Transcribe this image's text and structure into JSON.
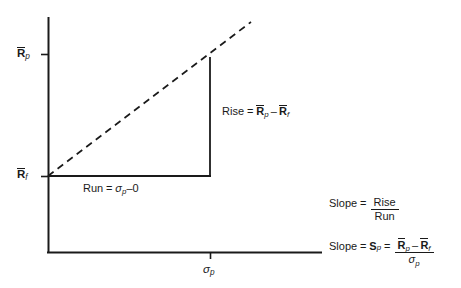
{
  "figure": {
    "width": 461,
    "height": 288,
    "background": "#ffffff",
    "line_color": "#1a1a1a"
  },
  "axes": {
    "y_axis": {
      "name": "expected-return-axis",
      "x": 48,
      "y_top": 17,
      "y_bottom": 253
    },
    "x_axis": {
      "name": "standard-deviation-axis",
      "y": 252,
      "x_left": 48,
      "x_right": 322
    },
    "y_ticks": [
      {
        "label_R": "R",
        "label_sub": "p",
        "value_y": 54,
        "name": "tick-rp"
      },
      {
        "label_R": "R",
        "label_sub": "f",
        "value_y": 176,
        "name": "tick-rf"
      }
    ],
    "x_ticks": [
      {
        "label_sigma": "σ",
        "label_sub": "p",
        "value_x": 210,
        "name": "tick-sigma-p"
      }
    ]
  },
  "labels": {
    "y_top": {
      "base": "R",
      "sub": "p",
      "overbar": true
    },
    "y_bottom": {
      "base": "R",
      "sub": "f",
      "overbar": true
    },
    "x_axis": {
      "base": "σ",
      "sub": "p",
      "overbar": false
    }
  },
  "annotations": {
    "rise": {
      "prefix": "Rise",
      "eq": "=",
      "term1": {
        "base": "R",
        "sub": "p",
        "overbar": true
      },
      "minus": "–",
      "term2": {
        "base": "R",
        "sub": "f",
        "overbar": true
      }
    },
    "run": {
      "prefix": "Run",
      "eq": "=",
      "term1": {
        "base": "σ",
        "sub": "p",
        "overbar": false
      },
      "minus": "–",
      "term2": "0"
    }
  },
  "formulas": {
    "slope_words": {
      "lhs": "Slope",
      "eq": "=",
      "numerator": "Rise",
      "denominator": "Run"
    },
    "slope_symbols": {
      "lhs": "Slope",
      "eq1": "=",
      "symbol_base": "S",
      "symbol_sub": "p",
      "eq2": "=",
      "num_term1": {
        "base": "R",
        "sub": "p",
        "overbar": true
      },
      "num_minus": "–",
      "num_term2": {
        "base": "R",
        "sub": "f",
        "overbar": true
      },
      "den": {
        "base": "σ",
        "sub": "p",
        "overbar": false
      }
    }
  },
  "line": {
    "name": "capital-allocation-line",
    "style": "dashed",
    "from": {
      "x": 48,
      "y": 176
    },
    "to": {
      "x": 251,
      "y": 22
    }
  },
  "triangle": {
    "run_segment": {
      "x1": 48,
      "y1": 176,
      "x2": 210,
      "y2": 176
    },
    "rise_segment": {
      "x1": 210,
      "y1": 176,
      "x2": 210,
      "y2": 57
    }
  }
}
